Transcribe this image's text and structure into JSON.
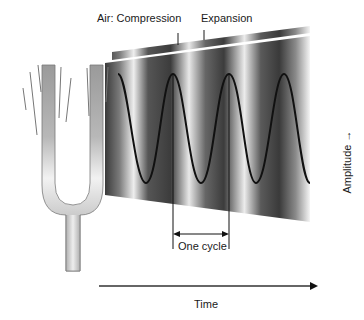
{
  "diagram": {
    "labels": {
      "compression": "Air: Compression",
      "expansion": "Expansion",
      "one_cycle": "One cycle",
      "time": "Time",
      "amplitude": "Amplitude →"
    },
    "elements": {
      "source": "tuning-fork",
      "wave": "sine-wave",
      "pressure_band": "compression-expansion-gradient"
    },
    "colors": {
      "ink": "#1a1a1a",
      "gradient_dark": "#3a3a3a",
      "gradient_light": "#f2f2f2",
      "fork_dark": "#8c8c8c",
      "fork_light": "#f0f0f0"
    }
  }
}
